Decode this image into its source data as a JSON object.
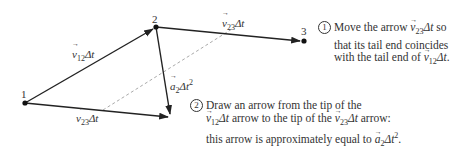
{
  "points": [
    {
      "id": "1",
      "label": "1",
      "x": 25,
      "y": 103
    },
    {
      "id": "2",
      "label": "2",
      "x": 156,
      "y": 27
    },
    {
      "id": "3",
      "label": "3",
      "x": 304,
      "y": 41
    }
  ],
  "vectors": {
    "v12": {
      "label_base": "v",
      "label_sub": "12",
      "label_suffix": "Δt"
    },
    "v23": {
      "label_base": "v",
      "label_sub": "23",
      "label_suffix": "Δt"
    },
    "v23_copy": {
      "label_base": "v",
      "label_sub": "23",
      "label_suffix": "Δt"
    },
    "a2": {
      "label_base": "a",
      "label_sub": "2",
      "label_suffix": "Δt",
      "label_sup": "2"
    }
  },
  "notes": {
    "step1": {
      "number": "1",
      "line1_pre": "Move the arrow ",
      "line1_vec_sub": "23",
      "line1_post": " so",
      "line2": "that its tail end coincides",
      "line3_pre": "with the tail end of ",
      "line3_vec_sub": "12",
      "line3_post": "."
    },
    "step2": {
      "number": "2",
      "line1": "Draw an arrow from the tip of the",
      "line2_vec_sub": "12",
      "line2_mid": " arrow to the tip of the ",
      "line2_vec2_sub": "23",
      "line2_post": " arrow:",
      "line3_pre": "this arrow is approximately equal to ",
      "line3_vec_sub": "2",
      "line3_post": "."
    }
  },
  "common": {
    "v": "v",
    "a": "a",
    "dt": "Δt",
    "sq": "2"
  },
  "colors": {
    "line": "#222222",
    "dashed": "#aaaaaa",
    "text": "#333333"
  }
}
